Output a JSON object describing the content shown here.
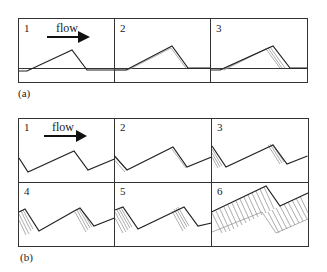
{
  "figure": {
    "part_a": {
      "label": "(a)",
      "panels": [
        {
          "number": "1",
          "flow_label": "flow"
        },
        {
          "number": "2"
        },
        {
          "number": "3"
        }
      ]
    },
    "part_b": {
      "label": "(b)",
      "panels": [
        {
          "number": "1",
          "flow_label": "flow"
        },
        {
          "number": "2"
        },
        {
          "number": "3"
        },
        {
          "number": "4"
        },
        {
          "number": "5"
        },
        {
          "number": "6"
        }
      ]
    },
    "flow_arrow": {
      "direction": "right",
      "icon": "arrow-right-icon"
    },
    "colors": {
      "line": "#222222",
      "ghost_line": "#999999",
      "hatch": "#888888",
      "frame": "#333333"
    }
  }
}
